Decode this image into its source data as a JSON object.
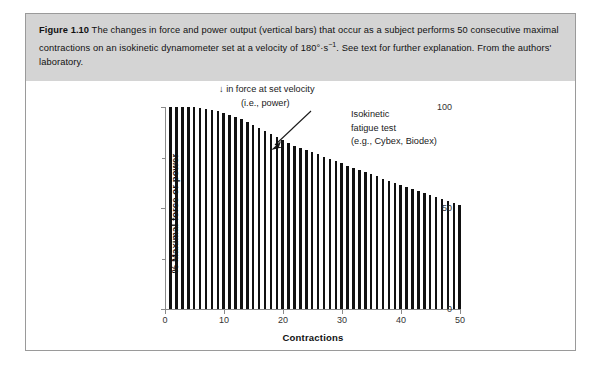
{
  "figure": {
    "label": "Figure 1.10",
    "caption_part1": "  The changes in force and power output (vertical bars) that occur as a subject performs 50 consecutive maximal contractions on an isokinetic dynamometer set at a velocity of 180°·s",
    "caption_superscript": "−1",
    "caption_part2": ". See text for further explanation. From the authors' laboratory.",
    "caption_band_color": "#d4d4d4",
    "border_color": "#9a9a9a"
  },
  "annotations": {
    "decline_line1": "↓ in force at set velocity",
    "decline_line2": "(i.e., power)",
    "test_line1": "Isokinetic",
    "test_line2": "fatigue test",
    "test_line3": "(e.g., Cybex, Biodex)"
  },
  "chart_data": {
    "type": "bar",
    "title": "",
    "xlabel": "Contractions",
    "ylabel": "% Maximal force or power",
    "xlim": [
      0,
      50
    ],
    "ylim": [
      0,
      100
    ],
    "grid": false,
    "legend": null,
    "bar_color": "#111111",
    "x_ticks": [
      0,
      10,
      20,
      30,
      40,
      50
    ],
    "x_tick_labels": [
      "0",
      "10",
      "20",
      "30",
      "40",
      "50"
    ],
    "y_ticks": [
      0,
      50,
      100
    ],
    "y_tick_labels": [
      "0",
      "50",
      "100"
    ],
    "y_minor_ticks": [
      25,
      75
    ],
    "x": [
      1,
      2,
      3,
      4,
      5,
      6,
      7,
      8,
      9,
      10,
      11,
      12,
      13,
      14,
      15,
      16,
      17,
      18,
      19,
      20,
      21,
      22,
      23,
      24,
      25,
      26,
      27,
      28,
      29,
      30,
      31,
      32,
      33,
      34,
      35,
      36,
      37,
      38,
      39,
      40,
      41,
      42,
      43,
      44,
      45,
      46,
      47,
      48,
      49,
      50
    ],
    "values": [
      100,
      100,
      100,
      100,
      100,
      99.5,
      99,
      98.5,
      98,
      97,
      96,
      95,
      94,
      92.5,
      91,
      89.5,
      88,
      86.5,
      85,
      83.5,
      82,
      80.5,
      79.5,
      78.5,
      77.5,
      76.5,
      75.5,
      74.5,
      73.5,
      72.5,
      71,
      70,
      69,
      68,
      67,
      66,
      64.5,
      63.5,
      62.5,
      61.5,
      60.5,
      59.5,
      58.5,
      57.5,
      56.5,
      55.5,
      54.5,
      53.5,
      52.5,
      51.5
    ]
  }
}
